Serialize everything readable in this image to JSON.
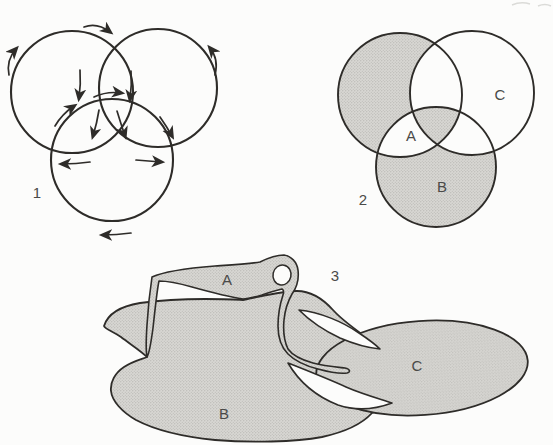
{
  "colors": {
    "background": "#fcfcfb",
    "line": "#2e2c29",
    "shade_base": "#d8d7d3",
    "shade_dot": "#a7a6a2",
    "label": "#4a4a48"
  },
  "fig1": {
    "number": "1"
  },
  "fig2": {
    "number": "2",
    "label_a": "A",
    "label_b": "B",
    "label_c": "C"
  },
  "fig3": {
    "number": "3",
    "label_a": "A",
    "label_b": "B",
    "label_c": "C"
  }
}
